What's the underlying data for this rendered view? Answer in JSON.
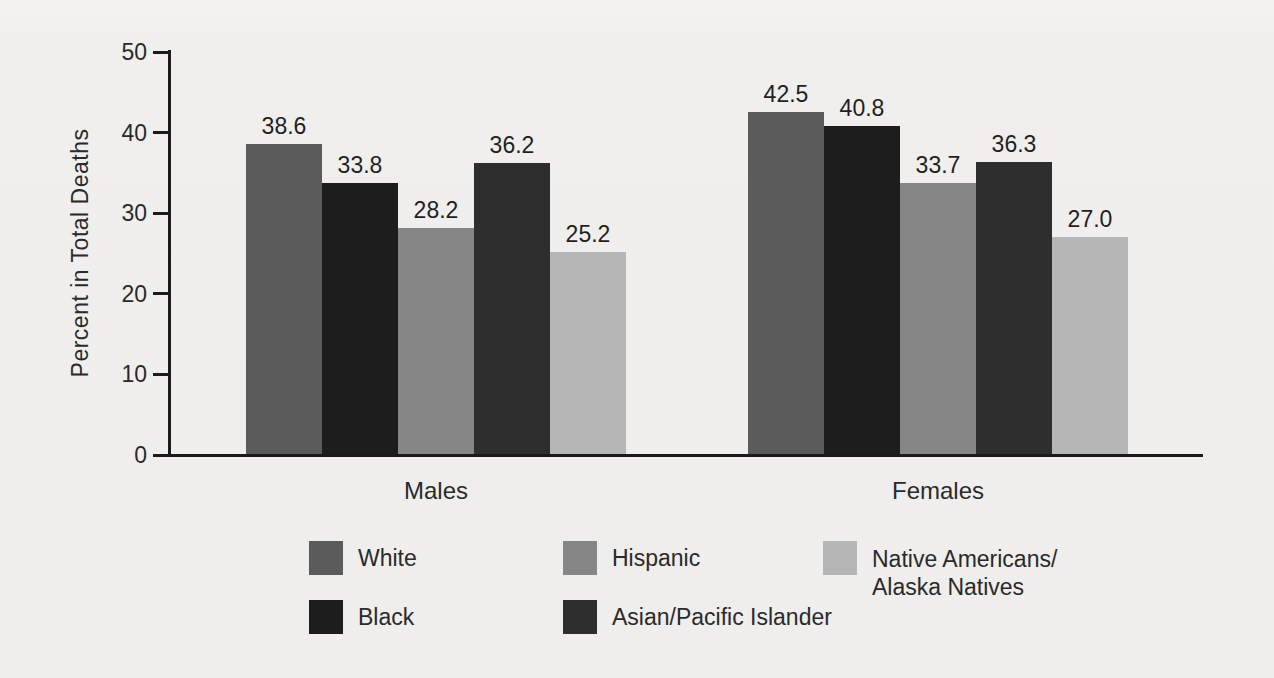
{
  "figure": {
    "kind": "scanned grouped bar chart"
  },
  "chart_data": {
    "type": "bar",
    "title": "",
    "xlabel": "",
    "ylabel": "Percent in Total Deaths",
    "ylim": [
      0,
      50
    ],
    "yticks": [
      0,
      10,
      20,
      30,
      40,
      50
    ],
    "grid": false,
    "legend_position": "bottom",
    "value_labels_decimals": 1,
    "background": "#efeeec",
    "axis_color": "#1b1b1b",
    "text_color": "#2a2a2a",
    "categories": [
      "Males",
      "Females"
    ],
    "series": [
      {
        "name": "White",
        "color": "#5b5b5b",
        "values": [
          38.6,
          42.5
        ],
        "legend_lines": [
          "White"
        ]
      },
      {
        "name": "Black",
        "color": "#1d1d1d",
        "values": [
          33.8,
          40.8
        ],
        "legend_lines": [
          "Black"
        ]
      },
      {
        "name": "Hispanic",
        "color": "#868686",
        "values": [
          28.2,
          33.7
        ],
        "legend_lines": [
          "Hispanic"
        ]
      },
      {
        "name": "Asian/Pacific Islander",
        "color": "#2e2e2e",
        "values": [
          36.2,
          36.3
        ],
        "legend_lines": [
          "Asian/Pacific Islander"
        ]
      },
      {
        "name": "Native Americans/Alaska Natives",
        "color": "#b6b6b6",
        "values": [
          25.2,
          27.0
        ],
        "legend_lines": [
          "Native Americans/",
          "Alaska Natives"
        ]
      }
    ]
  }
}
